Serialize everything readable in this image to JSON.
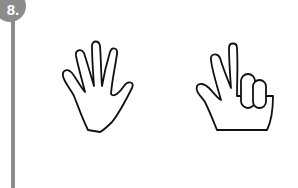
{
  "item": {
    "number": "8."
  },
  "colors": {
    "accent": "#8c8c8c",
    "stroke": "#111111"
  },
  "figures": [
    {
      "name": "open-hand-five-fingers",
      "fingers_up": 5
    },
    {
      "name": "hand-three-fingers",
      "fingers_up": 3
    }
  ]
}
